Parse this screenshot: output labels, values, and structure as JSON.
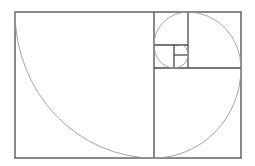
{
  "diagram": {
    "title": "",
    "type": "golden-spiral",
    "colors": {
      "background": "#ffffff",
      "frame_stroke": "#4a4a4a",
      "spiral_stroke": "#9a9a9a"
    },
    "outer_rect": {
      "x1": 15,
      "y1": 12,
      "x2": 241,
      "y2": 158
    },
    "squares": [
      {
        "id": "sq1",
        "x1": 15,
        "y1": 12,
        "x2": 154,
        "y2": 158
      },
      {
        "id": "sq2",
        "x1": 154,
        "y1": 68,
        "x2": 241,
        "y2": 158
      },
      {
        "id": "sq3",
        "x1": 188,
        "y1": 12,
        "x2": 241,
        "y2": 68
      },
      {
        "id": "sq4",
        "x1": 154,
        "y1": 12,
        "x2": 188,
        "y2": 45
      },
      {
        "id": "sq5",
        "x1": 154,
        "y1": 45,
        "x2": 174,
        "y2": 68
      },
      {
        "id": "sq6",
        "x1": 174,
        "y1": 55,
        "x2": 188,
        "y2": 68
      },
      {
        "id": "sq7",
        "x1": 174,
        "y1": 45,
        "x2": 188,
        "y2": 55
      }
    ]
  }
}
